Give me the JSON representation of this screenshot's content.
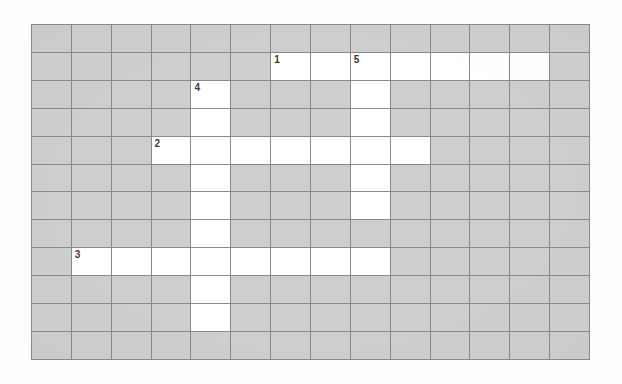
{
  "puzzle": {
    "type": "crossword-grid",
    "title": "",
    "columns": 14,
    "rows": 12,
    "colors": {
      "page_background": "#fdfdfb",
      "blocked_cell": "#cecece",
      "open_cell": "#ffffff",
      "gridline": "#8a8a8a",
      "clue_number_text": "#3b3b3b"
    },
    "clue_numbers": [
      {
        "number": "1",
        "row": 1,
        "col": 6
      },
      {
        "number": "5",
        "row": 1,
        "col": 8
      },
      {
        "number": "4",
        "row": 2,
        "col": 4
      },
      {
        "number": "2",
        "row": 4,
        "col": 3
      },
      {
        "number": "3",
        "row": 8,
        "col": 1
      }
    ],
    "open_cells": [
      {
        "row": 1,
        "col": 6
      },
      {
        "row": 1,
        "col": 7
      },
      {
        "row": 1,
        "col": 8
      },
      {
        "row": 1,
        "col": 9
      },
      {
        "row": 1,
        "col": 10
      },
      {
        "row": 1,
        "col": 11
      },
      {
        "row": 1,
        "col": 12
      },
      {
        "row": 2,
        "col": 4
      },
      {
        "row": 2,
        "col": 8
      },
      {
        "row": 3,
        "col": 4
      },
      {
        "row": 3,
        "col": 8
      },
      {
        "row": 4,
        "col": 3
      },
      {
        "row": 4,
        "col": 4
      },
      {
        "row": 4,
        "col": 5
      },
      {
        "row": 4,
        "col": 6
      },
      {
        "row": 4,
        "col": 7
      },
      {
        "row": 4,
        "col": 8
      },
      {
        "row": 4,
        "col": 9
      },
      {
        "row": 5,
        "col": 4
      },
      {
        "row": 5,
        "col": 8
      },
      {
        "row": 6,
        "col": 4
      },
      {
        "row": 6,
        "col": 8
      },
      {
        "row": 7,
        "col": 4
      },
      {
        "row": 8,
        "col": 1
      },
      {
        "row": 8,
        "col": 2
      },
      {
        "row": 8,
        "col": 3
      },
      {
        "row": 8,
        "col": 4
      },
      {
        "row": 8,
        "col": 5
      },
      {
        "row": 8,
        "col": 6
      },
      {
        "row": 8,
        "col": 7
      },
      {
        "row": 8,
        "col": 8
      },
      {
        "row": 9,
        "col": 4
      },
      {
        "row": 10,
        "col": 4
      }
    ],
    "entered_letters": []
  }
}
